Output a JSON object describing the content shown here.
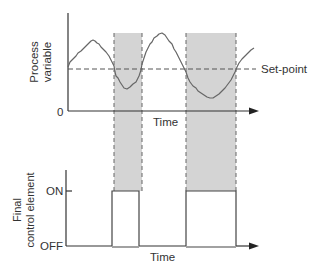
{
  "top_plot": {
    "ylabel_line1": "Process",
    "ylabel_line2": "variable",
    "y_origin_label": "0",
    "xlabel": "Time",
    "setpoint_label": "Set-point"
  },
  "bottom_plot": {
    "ylabel_line1": "Final",
    "ylabel_line2": "control element",
    "on_label": "ON",
    "off_label": "OFF",
    "xlabel": "Time"
  },
  "colors": {
    "axis": "#333333",
    "curve": "#555555",
    "shade": "#d4d4d4",
    "dash": "#555555",
    "background": "#ffffff"
  }
}
